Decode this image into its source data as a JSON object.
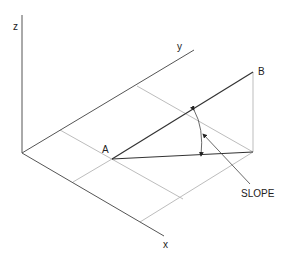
{
  "diagram": {
    "axes": {
      "x_label": "x",
      "y_label": "y",
      "z_label": "z"
    },
    "points": {
      "a_label": "A",
      "b_label": "B"
    },
    "annotation": {
      "slope_label": "SLOPE"
    },
    "colors": {
      "axis": "#555555",
      "line": "#333333",
      "construction": "#bdbdbd"
    }
  }
}
